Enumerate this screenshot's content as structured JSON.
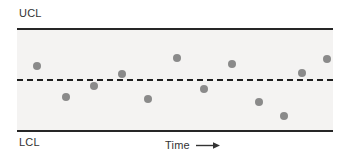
{
  "chart_data": {
    "type": "scatter",
    "title": "",
    "subtitle": "",
    "xlabel": "Time",
    "ylabel": "",
    "grid": false,
    "legend": null,
    "xlim": [
      0,
      13
    ],
    "ylim": [
      0,
      100
    ],
    "axis_arrow": "right-arrow-icon",
    "annotations": [
      {
        "name": "upper-control-limit",
        "label": "UCL",
        "value": 100,
        "style": "solid"
      },
      {
        "name": "center-line",
        "label": "",
        "value": 50,
        "style": "dashed"
      },
      {
        "name": "lower-control-limit",
        "label": "LCL",
        "value": 0,
        "style": "solid"
      }
    ],
    "series": [
      {
        "name": "samples",
        "color": "#8a8a8a",
        "x": [
          1,
          2,
          3,
          4,
          5,
          6,
          7,
          8,
          9,
          10,
          11,
          12
        ],
        "values": [
          64,
          34,
          45,
          56,
          32,
          73,
          42,
          66,
          29,
          15,
          57,
          71
        ],
        "points": [
          {
            "px": 37,
            "py": 66
          },
          {
            "px": 66,
            "py": 97
          },
          {
            "px": 94,
            "py": 86
          },
          {
            "px": 122,
            "py": 74
          },
          {
            "px": 148,
            "py": 99
          },
          {
            "px": 177,
            "py": 58
          },
          {
            "px": 204,
            "py": 89
          },
          {
            "px": 232,
            "py": 64
          },
          {
            "px": 259,
            "py": 102
          },
          {
            "px": 284,
            "py": 116
          },
          {
            "px": 302,
            "py": 73
          },
          {
            "px": 327,
            "py": 59
          }
        ]
      }
    ]
  },
  "labels": {
    "ucl": "UCL",
    "lcl": "LCL",
    "time": "Time"
  },
  "colors": {
    "point": "#8a8a8a",
    "line": "#262626",
    "band": "#f4f3f2",
    "text": "#333333"
  }
}
